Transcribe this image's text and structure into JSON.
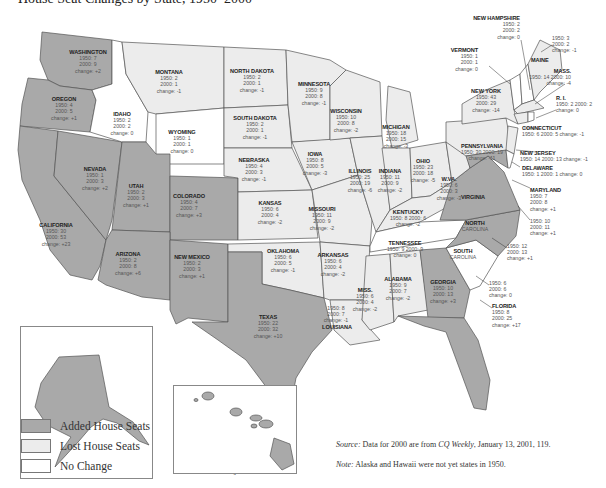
{
  "title": "House Seat Changes by State, 1950–2000",
  "legend": {
    "items": [
      {
        "label": "Added House Seats",
        "color": "#a9a9a9"
      },
      {
        "label": "Lost House Seats",
        "color": "#ececec"
      },
      {
        "label": "No Change",
        "color": "#ffffff"
      }
    ]
  },
  "labels": {
    "y1950": "1950:",
    "y2000": "2000:",
    "change": "change:"
  },
  "notes": {
    "source_label": "Source:",
    "source_text": " Data for 2000 are from ",
    "source_pub": "CQ Weekly",
    "source_rest": ", January 13, 2001, 119.",
    "note_label": "Note:",
    "note_text": " Alaska and Hawaii were not yet states in 1950."
  },
  "chart_data": {
    "type": "choropleth-map",
    "categories": [
      "Added House Seats",
      "Lost House Seats",
      "No Change"
    ],
    "states": [
      {
        "name": "WASHINGTON",
        "y1950": 7,
        "y2000": 9,
        "change": "+2",
        "cat": "added"
      },
      {
        "name": "OREGON",
        "y1950": 4,
        "y2000": 5,
        "change": "+1",
        "cat": "added"
      },
      {
        "name": "CALIFORNIA",
        "y1950": 30,
        "y2000": 53,
        "change": "+23",
        "cat": "added"
      },
      {
        "name": "IDAHO",
        "y1950": 2,
        "y2000": 2,
        "change": "0",
        "cat": "none"
      },
      {
        "name": "NEVADA",
        "y1950": 1,
        "y2000": 3,
        "change": "+2",
        "cat": "added"
      },
      {
        "name": "UTAH",
        "y1950": 2,
        "y2000": 3,
        "change": "+1",
        "cat": "added"
      },
      {
        "name": "ARIZONA",
        "y1950": 2,
        "y2000": 8,
        "change": "+6",
        "cat": "added"
      },
      {
        "name": "MONTANA",
        "y1950": 2,
        "y2000": 1,
        "change": "-1",
        "cat": "lost"
      },
      {
        "name": "WYOMING",
        "y1950": 1,
        "y2000": 1,
        "change": "0",
        "cat": "none"
      },
      {
        "name": "COLORADO",
        "y1950": 4,
        "y2000": 7,
        "change": "+3",
        "cat": "added"
      },
      {
        "name": "NEW MEXICO",
        "y1950": 2,
        "y2000": 3,
        "change": "+1",
        "cat": "added"
      },
      {
        "name": "NORTH DAKOTA",
        "y1950": 2,
        "y2000": 1,
        "change": "-1",
        "cat": "lost"
      },
      {
        "name": "SOUTH DAKOTA",
        "y1950": 2,
        "y2000": 1,
        "change": "-1",
        "cat": "lost"
      },
      {
        "name": "NEBRASKA",
        "y1950": 4,
        "y2000": 3,
        "change": "-1",
        "cat": "lost"
      },
      {
        "name": "KANSAS",
        "y1950": 6,
        "y2000": 4,
        "change": "-2",
        "cat": "lost"
      },
      {
        "name": "OKLAHOMA",
        "y1950": 6,
        "y2000": 5,
        "change": "-1",
        "cat": "lost"
      },
      {
        "name": "TEXAS",
        "y1950": 22,
        "y2000": 32,
        "change": "+10",
        "cat": "added"
      },
      {
        "name": "MINNESOTA",
        "y1950": 9,
        "y2000": 8,
        "change": "-1",
        "cat": "lost"
      },
      {
        "name": "IOWA",
        "y1950": 8,
        "y2000": 5,
        "change": "-3",
        "cat": "lost"
      },
      {
        "name": "MISSOURI",
        "y1950": 11,
        "y2000": 9,
        "change": "-2",
        "cat": "lost"
      },
      {
        "name": "ARKANSAS",
        "y1950": 6,
        "y2000": 4,
        "change": "-2",
        "cat": "lost"
      },
      {
        "name": "LOUISIANA",
        "y1950": 8,
        "y2000": 7,
        "change": "-1",
        "cat": "lost"
      },
      {
        "name": "WISCONSIN",
        "y1950": 10,
        "y2000": 8,
        "change": "-2",
        "cat": "lost"
      },
      {
        "name": "ILLINOIS",
        "y1950": 25,
        "y2000": 19,
        "change": "-6",
        "cat": "lost"
      },
      {
        "name": "MICHIGAN",
        "y1950": 18,
        "y2000": 15,
        "change": "-3",
        "cat": "lost"
      },
      {
        "name": "INDIANA",
        "y1950": 11,
        "y2000": 9,
        "change": "-2",
        "cat": "lost"
      },
      {
        "name": "OHIO",
        "y1950": 23,
        "y2000": 18,
        "change": "-5",
        "cat": "lost"
      },
      {
        "name": "KENTUCKY",
        "y1950": 8,
        "y2000": 6,
        "change": "-2",
        "cat": "lost"
      },
      {
        "name": "TENNESSEE",
        "y1950": 9,
        "y2000": 9,
        "change": "0",
        "cat": "none"
      },
      {
        "name": "MISS.",
        "y1950": 6,
        "y2000": 4,
        "change": "-2",
        "cat": "lost"
      },
      {
        "name": "ALABAMA",
        "y1950": 9,
        "y2000": 7,
        "change": "-2",
        "cat": "lost"
      },
      {
        "name": "GEORGIA",
        "y1950": 10,
        "y2000": 13,
        "change": "+3",
        "cat": "added"
      },
      {
        "name": "FLORIDA",
        "y1950": 8,
        "y2000": 25,
        "change": "+17",
        "cat": "added"
      },
      {
        "name": "SOUTH CAROLINA",
        "y1950": 6,
        "y2000": 6,
        "change": "0",
        "cat": "none"
      },
      {
        "name": "NORTH CAROLINA",
        "y1950": 12,
        "y2000": 13,
        "change": "+1",
        "cat": "added"
      },
      {
        "name": "VIRGINIA",
        "y1950": 10,
        "y2000": 11,
        "change": "+1",
        "cat": "added"
      },
      {
        "name": "W.VA.",
        "y1950": 6,
        "y2000": 3,
        "change": "-3",
        "cat": "lost"
      },
      {
        "name": "MARYLAND",
        "y1950": 7,
        "y2000": 8,
        "change": "+1",
        "cat": "added"
      },
      {
        "name": "DELAWARE",
        "y1950": 1,
        "y2000": 1,
        "change": "0",
        "cat": "none"
      },
      {
        "name": "PENNSYLVANIA",
        "y1950": 30,
        "y2000": 19,
        "change": "-11",
        "cat": "lost"
      },
      {
        "name": "NEW JERSEY",
        "y1950": 14,
        "y2000": 13,
        "change": "-1",
        "cat": "lost"
      },
      {
        "name": "NEW YORK",
        "y1950": 43,
        "y2000": 29,
        "change": "-14",
        "cat": "lost"
      },
      {
        "name": "CONNECTICUT",
        "y1950": 6,
        "y2000": 5,
        "change": "-1",
        "cat": "lost"
      },
      {
        "name": "R.I.",
        "y1950": 2,
        "y2000": 2,
        "change": "0",
        "cat": "none"
      },
      {
        "name": "MASS.",
        "y1950": 14,
        "y2000": 10,
        "change": "-4",
        "cat": "lost"
      },
      {
        "name": "VERMONT",
        "y1950": 1,
        "y2000": 1,
        "change": "0",
        "cat": "none"
      },
      {
        "name": "NEW HAMPSHIRE",
        "y1950": 2,
        "y2000": 2,
        "change": "0",
        "cat": "none"
      },
      {
        "name": "MAINE",
        "y1950": 3,
        "y2000": 2,
        "change": "-1",
        "cat": "lost"
      },
      {
        "name": "ALASKA",
        "y1950": 0,
        "y2000": 1,
        "change": "+1",
        "cat": "added"
      },
      {
        "name": "HAWAII",
        "y1950": 0,
        "y2000": 2,
        "change": "+2",
        "cat": "added"
      }
    ]
  },
  "state_labels": [
    {
      "name": "WASHINGTON",
      "a": "1950: 7",
      "b": "2000: 9",
      "c": "change: +2",
      "x": 88,
      "y": 49
    },
    {
      "name": "OREGON",
      "a": "1950: 4",
      "b": "2000: 5",
      "c": "change: +1",
      "x": 64,
      "y": 96
    },
    {
      "name": "IDAHO",
      "a": "1950: 2",
      "b": "2000: 2",
      "c": "change: 0",
      "x": 122,
      "y": 111
    },
    {
      "name": "MONTANA",
      "a": "1950: 2",
      "b": "2000: 1",
      "c": "change: -1",
      "x": 169,
      "y": 69
    },
    {
      "name": "WYOMING",
      "a": "1950: 1",
      "b": "2000: 1",
      "c": "change: 0",
      "x": 182,
      "y": 129
    },
    {
      "name": "NORTH DAKOTA",
      "a": "1950: 2",
      "b": "2000: 1",
      "c": "change: -1",
      "x": 252,
      "y": 68
    },
    {
      "name": "SOUTH DAKOTA",
      "a": "1950: 2",
      "b": "2000: 1",
      "c": "change: -1",
      "x": 255,
      "y": 115
    },
    {
      "name": "MINNESOTA",
      "a": "1950: 9",
      "b": "2000: 8",
      "c": "change: -1",
      "x": 314,
      "y": 81
    },
    {
      "name": "WISCONSIN",
      "a": "1950: 10",
      "b": "2000: 8",
      "c": "change: -2",
      "x": 346,
      "y": 108
    },
    {
      "name": "MICHIGAN",
      "a": "1950: 18",
      "b": "2000: 15",
      "c": "change: -3",
      "x": 396,
      "y": 124
    },
    {
      "name": "NEBRASKA",
      "a": "1950: 4",
      "b": "2000: 3",
      "c": "change: -1",
      "x": 254,
      "y": 157
    },
    {
      "name": "IOWA",
      "a": "1950: 8",
      "b": "2000: 5",
      "c": "change: -3",
      "x": 315,
      "y": 151
    },
    {
      "name": "ILLINOIS",
      "a": "1950: 25",
      "b": "2000: 19",
      "c": "change: -6",
      "x": 360,
      "y": 168
    },
    {
      "name": "INDIANA",
      "a": "1950: 11",
      "b": "2000: 9",
      "c": "change: -2",
      "x": 390,
      "y": 168
    },
    {
      "name": "OHIO",
      "a": "1950: 23",
      "b": "2000: 18",
      "c": "change: -5",
      "x": 423,
      "y": 158
    },
    {
      "name": "NEVADA",
      "a": "1950: 1",
      "b": "2000: 3",
      "c": "change: +2",
      "x": 95,
      "y": 166
    },
    {
      "name": "UTAH",
      "a": "1950: 2",
      "b": "2000: 3",
      "c": "change: +1",
      "x": 136,
      "y": 183
    },
    {
      "name": "COLORADO",
      "a": "1950: 4",
      "b": "2000: 7",
      "c": "change: +3",
      "x": 189,
      "y": 193
    },
    {
      "name": "KANSAS",
      "a": "1950: 6",
      "b": "2000: 4",
      "c": "change: -2",
      "x": 270,
      "y": 200
    },
    {
      "name": "MISSOURI",
      "a": "1950: 11",
      "b": "2000: 9",
      "c": "change: -2",
      "x": 322,
      "y": 206
    },
    {
      "name": "CALIFORNIA",
      "a": "1950: 30",
      "b": "2000: 53",
      "c": "change: +23",
      "x": 56,
      "y": 222
    },
    {
      "name": "ARIZONA",
      "a": "1950: 2",
      "b": "2000: 8",
      "c": "change: +6",
      "x": 128,
      "y": 251
    },
    {
      "name": "NEW MEXICO",
      "a": "1950: 2",
      "b": "2000: 3",
      "c": "change: +1",
      "x": 192,
      "y": 254
    },
    {
      "name": "OKLAHOMA",
      "a": "1950: 6",
      "b": "2000: 5",
      "c": "change: -1",
      "x": 283,
      "y": 248
    },
    {
      "name": "ARKANSAS",
      "a": "1950: 6",
      "b": "2000: 4",
      "c": "change: -2",
      "x": 333,
      "y": 252
    },
    {
      "name": "TEXAS",
      "a": "1950: 22",
      "b": "2000: 32",
      "c": "change: +10",
      "x": 268,
      "y": 314
    },
    {
      "name": "MISS.",
      "a": "1950: 6",
      "b": "2000: 4",
      "c": "change: -2",
      "x": 365,
      "y": 287
    },
    {
      "name": "ALABAMA",
      "a": "1950: 9",
      "b": "2000: 7",
      "c": "change: -2",
      "x": 398,
      "y": 276
    },
    {
      "name": "GEORGIA",
      "a": "1950: 10",
      "b": "2000: 13",
      "c": "change: +3",
      "x": 443,
      "y": 279
    },
    {
      "name": "ALASKA",
      "a": "1950: 0",
      "b": "2000: 1",
      "c": "change: +1",
      "x": 76,
      "y": 365
    },
    {
      "name": "HAWAII",
      "a": "1950: 0",
      "b": "2000: 2",
      "c": "change: +2",
      "x": 235,
      "y": 450
    }
  ],
  "callouts": [
    {
      "name": "NEW HAMPSHIRE",
      "a": "1950: 2",
      "b": "2000: 2",
      "c": "change: 0",
      "x": 520,
      "y": 15,
      "align": "right"
    },
    {
      "name": "",
      "a": "1950: 3",
      "b": "2000: 2",
      "c": "change: -1",
      "x": 552,
      "y": 35,
      "align": "left"
    },
    {
      "name": "MAINE",
      "a": "",
      "b": "",
      "c": "",
      "x": 531,
      "y": 57,
      "align": "left"
    },
    {
      "name": "VERMONT",
      "a": "1950: 1",
      "b": "2000: 1",
      "c": "change: 0",
      "x": 478,
      "y": 47,
      "align": "right"
    },
    {
      "name": "MASS.",
      "a": "1950: 14  2000: 10",
      "b": "change: -4",
      "c": "",
      "x": 571,
      "y": 68,
      "align": "right"
    },
    {
      "name": "NEW YORK",
      "a": "1950: 43",
      "b": "2000: 29",
      "c": "change: -14",
      "x": 486,
      "y": 88,
      "align": "center"
    },
    {
      "name": "R. I.",
      "a": "1950: 2  2000: 2",
      "b": "change: 0",
      "c": "",
      "x": 556,
      "y": 95,
      "align": "left"
    },
    {
      "name": "CONNECTICUT",
      "a": "1950: 6  2000: 5  change: -1",
      "b": "",
      "c": "",
      "x": 522,
      "y": 125,
      "align": "left"
    },
    {
      "name": "PENNSYLVANIA",
      "a": "1950: 30  2000: 19",
      "b": "change: -11",
      "c": "",
      "x": 482,
      "y": 143,
      "align": "center"
    },
    {
      "name": "NEW JERSEY",
      "a": "1950: 14  2000: 13  change: -1",
      "b": "",
      "c": "",
      "x": 520,
      "y": 150,
      "align": "left"
    },
    {
      "name": "DELAWARE",
      "a": "1950: 1  2000: 1  change: 0",
      "b": "",
      "c": "",
      "x": 522,
      "y": 165,
      "align": "left"
    },
    {
      "name": "MARYLAND",
      "a": "1950: 7",
      "b": "2000: 8",
      "c": "change: +1",
      "x": 530,
      "y": 187,
      "align": "left"
    },
    {
      "name": "W.VA.",
      "a": "1950: 6",
      "b": "2000: 3",
      "c": "change: -3",
      "x": 449,
      "y": 176,
      "align": "center"
    },
    {
      "name": "VIRGINIA",
      "a": "",
      "b": "",
      "c": "",
      "x": 473,
      "y": 194,
      "align": "center"
    },
    {
      "name": "KENTUCKY",
      "a": "1950: 8  2000: 6",
      "b": "change: -2",
      "c": "",
      "x": 408,
      "y": 209,
      "align": "center"
    },
    {
      "name": "",
      "a": "1950: 10",
      "b": "2000: 11",
      "c": "change: +1",
      "x": 530,
      "y": 218,
      "align": "left"
    },
    {
      "name": "NORTH",
      "a": "CAROLINA",
      "b": "",
      "c": "",
      "x": 475,
      "y": 220,
      "align": "center"
    },
    {
      "name": "TENNESSEE",
      "a": "1950: 9  2000: 9",
      "b": "change: 0",
      "c": "",
      "x": 405,
      "y": 240,
      "align": "center"
    },
    {
      "name": "",
      "a": "1950: 12",
      "b": "2000: 13",
      "c": "change: +1",
      "x": 507,
      "y": 243,
      "align": "left"
    },
    {
      "name": "SOUTH",
      "a": "CAROLINA",
      "b": "",
      "c": "",
      "x": 463,
      "y": 248,
      "align": "center"
    },
    {
      "name": "",
      "a": "1950: 6",
      "b": "2000: 6",
      "c": "change: 0",
      "x": 489,
      "y": 280,
      "align": "left"
    },
    {
      "name": "",
      "a": "1950: 8",
      "b": "2000: 7",
      "c": "change: -1",
      "x": 336,
      "y": 305,
      "align": "center"
    },
    {
      "name": "LOUISIANA",
      "a": "",
      "b": "",
      "c": "",
      "x": 337,
      "y": 324,
      "align": "center"
    },
    {
      "name": "FLORIDA",
      "a": "1950: 8",
      "b": "2000: 25",
      "c": "change: +17",
      "x": 492,
      "y": 303,
      "align": "left"
    }
  ]
}
